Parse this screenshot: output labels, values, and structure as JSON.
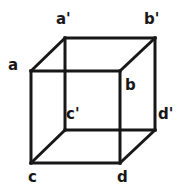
{
  "figure": {
    "stroke_color": "#171717",
    "background_color": "#ffffff",
    "stroke_width": 3,
    "labels": [
      {
        "id": "a-prime",
        "text": "a'",
        "x": 56,
        "y": 12
      },
      {
        "id": "b-prime",
        "text": "b'",
        "x": 144,
        "y": 12
      },
      {
        "id": "a",
        "text": "a",
        "x": 8,
        "y": 58
      },
      {
        "id": "b",
        "text": "b",
        "x": 125,
        "y": 78
      },
      {
        "id": "c-prime",
        "text": "c'",
        "x": 66,
        "y": 107
      },
      {
        "id": "d-prime",
        "text": "d'",
        "x": 158,
        "y": 107
      },
      {
        "id": "c",
        "text": "c",
        "x": 28,
        "y": 170
      },
      {
        "id": "d",
        "text": "d",
        "x": 117,
        "y": 170
      }
    ],
    "vertices": {
      "a": {
        "x": 31,
        "y": 71
      },
      "b": {
        "x": 120,
        "y": 71
      },
      "c": {
        "x": 31,
        "y": 163
      },
      "d": {
        "x": 120,
        "y": 163
      },
      "a_prime": {
        "x": 65,
        "y": 38
      },
      "b_prime": {
        "x": 155,
        "y": 38
      },
      "c_prime": {
        "x": 65,
        "y": 130
      },
      "d_prime": {
        "x": 155,
        "y": 130
      }
    },
    "edges": [
      {
        "id": "edge-a-b",
        "from": "a",
        "to": "b"
      },
      {
        "id": "edge-b-d",
        "from": "b",
        "to": "d"
      },
      {
        "id": "edge-d-c",
        "from": "d",
        "to": "c"
      },
      {
        "id": "edge-c-a",
        "from": "c",
        "to": "a"
      },
      {
        "id": "edge-ap-bp",
        "from": "a_prime",
        "to": "b_prime"
      },
      {
        "id": "edge-bp-dp",
        "from": "b_prime",
        "to": "d_prime"
      },
      {
        "id": "edge-dp-cp",
        "from": "d_prime",
        "to": "c_prime"
      },
      {
        "id": "edge-cp-ap",
        "from": "c_prime",
        "to": "a_prime"
      },
      {
        "id": "edge-a-ap",
        "from": "a",
        "to": "a_prime"
      },
      {
        "id": "edge-b-bp",
        "from": "b",
        "to": "b_prime"
      },
      {
        "id": "edge-c-cp",
        "from": "c",
        "to": "c_prime"
      },
      {
        "id": "edge-d-dp",
        "from": "d",
        "to": "d_prime"
      }
    ]
  }
}
